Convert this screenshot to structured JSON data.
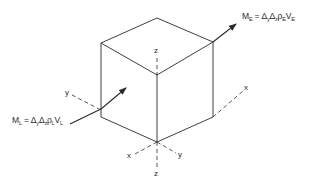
{
  "diagram": {
    "inflow_label": {
      "symbol": "M",
      "sub": "L",
      "rhs": " = Δ",
      "parts": [
        "M",
        "L",
        " = Δ",
        "y",
        "Δ",
        "z",
        "ρ",
        "L",
        "V",
        "L"
      ]
    },
    "outflow_label": {
      "parts": [
        "M",
        "E",
        " = Δ",
        "y",
        "Δ",
        "z",
        "ρ",
        "E",
        "V",
        "E"
      ]
    },
    "axes": {
      "x_right": "x",
      "y_left": "y",
      "z_top": "z",
      "x_bottom": "x",
      "y_bottom": "y",
      "z_bottom": "z"
    },
    "colors": {
      "line": "#2a2a2a",
      "background": "#ffffff"
    }
  }
}
